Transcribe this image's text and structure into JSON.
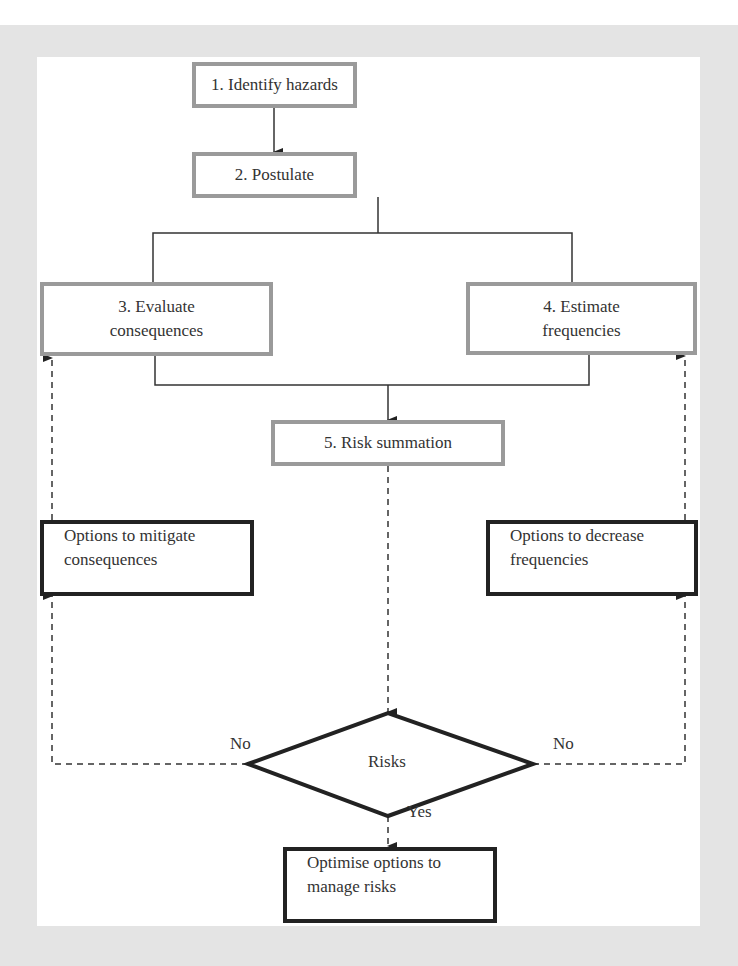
{
  "diagram": {
    "steps": [
      {
        "id": "identify",
        "label": "1. Identify hazards"
      },
      {
        "id": "postulate",
        "label": "2. Postulate"
      },
      {
        "id": "evaluate",
        "label": "3. Evaluate consequences",
        "line1": "3. Evaluate",
        "line2": "consequences"
      },
      {
        "id": "estimate",
        "label": "4. Estimate frequencies",
        "line1": "4. Estimate",
        "line2": "frequencies"
      },
      {
        "id": "summation",
        "label": "5. Risk summation"
      }
    ],
    "options": {
      "mitigate": {
        "line1": "Options to mitigate",
        "line2": "consequences"
      },
      "decrease": {
        "line1": "Options to decrease",
        "line2": "frequencies"
      },
      "optimise": {
        "line1": "Optimise options to",
        "line2": "manage risks"
      }
    },
    "decision": {
      "label": "Risks",
      "no_left": "No",
      "no_right": "No",
      "yes": "Yes"
    },
    "edges": [
      {
        "from": "identify",
        "to": "postulate",
        "style": "solid"
      },
      {
        "from": "postulate",
        "to": "evaluate",
        "style": "solid"
      },
      {
        "from": "postulate",
        "to": "estimate",
        "style": "solid"
      },
      {
        "from": "evaluate",
        "to": "summation",
        "style": "solid"
      },
      {
        "from": "estimate",
        "to": "summation",
        "style": "solid"
      },
      {
        "from": "summation",
        "to": "decision",
        "style": "dashed"
      },
      {
        "from": "decision",
        "to": "mitigate",
        "label": "No",
        "style": "dashed"
      },
      {
        "from": "decision",
        "to": "decrease",
        "label": "No",
        "style": "dashed"
      },
      {
        "from": "mitigate",
        "to": "evaluate",
        "style": "dashed"
      },
      {
        "from": "decrease",
        "to": "estimate",
        "style": "dashed"
      },
      {
        "from": "decision",
        "to": "optimise",
        "label": "Yes",
        "style": "dashed"
      }
    ],
    "colors": {
      "frame": "#e4e4e4",
      "step_border": "#9a9a9a",
      "option_border": "#222222",
      "text": "#333333"
    }
  }
}
